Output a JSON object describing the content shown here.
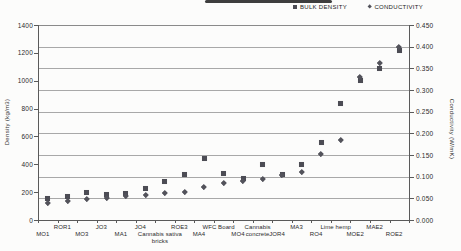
{
  "artifact": {
    "top_smudge": true
  },
  "legend": {
    "items": [
      {
        "label": "BULK DENSITY",
        "marker": "square-icon"
      },
      {
        "label": "CONDUCTIVITY",
        "marker": "diamond-icon"
      }
    ]
  },
  "chart_data": {
    "type": "scatter",
    "title": "",
    "legend_position": "top",
    "grid": "horizontal",
    "categories": [
      "MO1",
      "ROR1",
      "MO3",
      "JO3",
      "MA1",
      "JO4",
      "Cannabis sativa\nbricks",
      "ROE3",
      "MA4",
      "WFC Board",
      "MO4",
      "Cannabis\nconcrete",
      "JOR4",
      "MA3",
      "RO4",
      "Lime hemp",
      "MOE2",
      "MAE2",
      "ROE2"
    ],
    "series": [
      {
        "name": "BULK DENSITY",
        "axis": "left",
        "marker": "square",
        "color": "#4c4c54",
        "values": [
          155,
          168,
          195,
          180,
          190,
          225,
          280,
          325,
          445,
          335,
          295,
          398,
          325,
          400,
          560,
          840,
          1000,
          1090,
          1220
        ]
      },
      {
        "name": "CONDUCTIVITY",
        "axis": "right",
        "marker": "diamond",
        "color": "#53535b",
        "values": [
          0.04,
          0.045,
          0.05,
          0.052,
          0.055,
          0.059,
          0.062,
          0.065,
          0.077,
          0.086,
          0.091,
          0.096,
          0.105,
          0.112,
          0.152,
          0.186,
          0.33,
          0.362,
          0.4
        ]
      }
    ],
    "left_axis": {
      "label": "Density (kg/m3)",
      "min": 0,
      "max": 1400,
      "step": 200,
      "ticks": [
        "0",
        "200",
        "400",
        "600",
        "800",
        "1000",
        "1200",
        "1400"
      ]
    },
    "right_axis": {
      "label": "Conductivity (W/mK)",
      "min": 0,
      "max": 0.45,
      "step": 0.05,
      "ticks": [
        "0.000",
        "0.050",
        "0.100",
        "0.150",
        "0.200",
        "0.250",
        "0.300",
        "0.350",
        "0.400",
        "0.450"
      ]
    }
  }
}
